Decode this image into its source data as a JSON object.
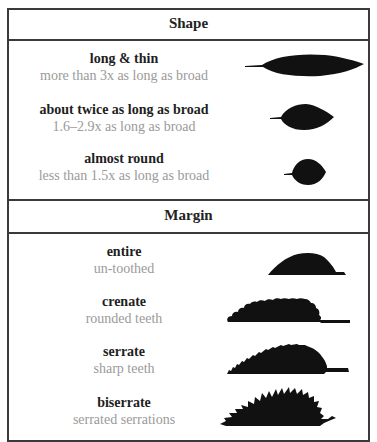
{
  "sections": [
    {
      "title": "Shape",
      "items": [
        {
          "name": "long & thin",
          "description": "more than 3x as long as broad",
          "icon": "long-thin-leaf-icon"
        },
        {
          "name": "about twice as long as broad",
          "description": "1.6–2.9x as long as broad",
          "icon": "ovate-leaf-icon"
        },
        {
          "name": "almost round",
          "description": "less than 1.5x as long as broad",
          "icon": "round-leaf-icon"
        }
      ]
    },
    {
      "title": "Margin",
      "items": [
        {
          "name": "entire",
          "description": "un-toothed",
          "icon": "entire-margin-leaf-icon"
        },
        {
          "name": "crenate",
          "description": "rounded teeth",
          "icon": "crenate-margin-leaf-icon"
        },
        {
          "name": "serrate",
          "description": "sharp teeth",
          "icon": "serrate-margin-leaf-icon"
        },
        {
          "name": "biserrate",
          "description": "serrated serrations",
          "icon": "biserrate-margin-leaf-icon"
        }
      ]
    }
  ],
  "colors": {
    "border": "#3a3a3a",
    "title_text": "#1e1e1e",
    "description_text": "#9a9a9a",
    "leaf_fill": "#111111"
  }
}
